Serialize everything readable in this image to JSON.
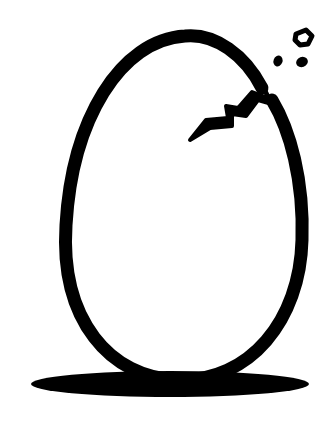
{
  "illustration": {
    "title": "Cracked egg",
    "colors": {
      "background": "#ffffff",
      "ink": "#000000"
    },
    "elements": [
      "egg-outline",
      "crack",
      "shell-fragment",
      "shell-dot",
      "shadow"
    ]
  }
}
